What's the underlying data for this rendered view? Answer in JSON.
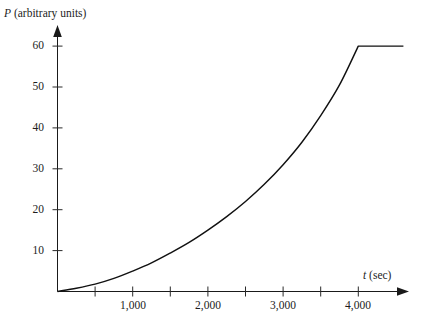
{
  "chart_data": {
    "type": "line",
    "title": "",
    "xlabel": "t (sec)",
    "ylabel": "P (arbitrary units)",
    "xlabel_symbol": "t",
    "xlabel_unit": "(sec)",
    "ylabel_symbol": "P",
    "ylabel_unit": "(arbitrary units)",
    "grid": false,
    "legend": "none",
    "xlim": [
      0,
      4600
    ],
    "ylim": [
      0,
      65
    ],
    "x_ticks_labeled": [
      1000,
      2000,
      3000,
      4000
    ],
    "x_tick_labels": [
      "1,000",
      "2,000",
      "3,000",
      "4,000"
    ],
    "x_ticks_minor": [
      500,
      1500,
      2500,
      3500,
      4500
    ],
    "y_ticks_labeled": [
      10,
      20,
      30,
      40,
      50,
      60
    ],
    "y_tick_labels": [
      "10",
      "20",
      "30",
      "40",
      "50",
      "60"
    ],
    "plateau_value": 60,
    "plateau_start_x": 4000,
    "series": [
      {
        "name": "P(t)",
        "color": "#111111",
        "x": [
          0,
          250,
          500,
          750,
          1000,
          1250,
          1500,
          1750,
          2000,
          2250,
          2500,
          2750,
          3000,
          3250,
          3500,
          3750,
          4000,
          4250,
          4500,
          4600
        ],
        "values": [
          0,
          0.8,
          1.8,
          3.2,
          5.0,
          7.0,
          9.4,
          12.0,
          15.0,
          18.3,
          22.0,
          26.2,
          31.0,
          36.5,
          43.0,
          50.5,
          60.0,
          60.0,
          60.0,
          60.0
        ]
      }
    ]
  },
  "colors": {
    "curve": "#111111",
    "axis": "#1a1a1a",
    "tick": "#2a2a2a",
    "text": "#1d1d1d",
    "background": "#ffffff"
  }
}
